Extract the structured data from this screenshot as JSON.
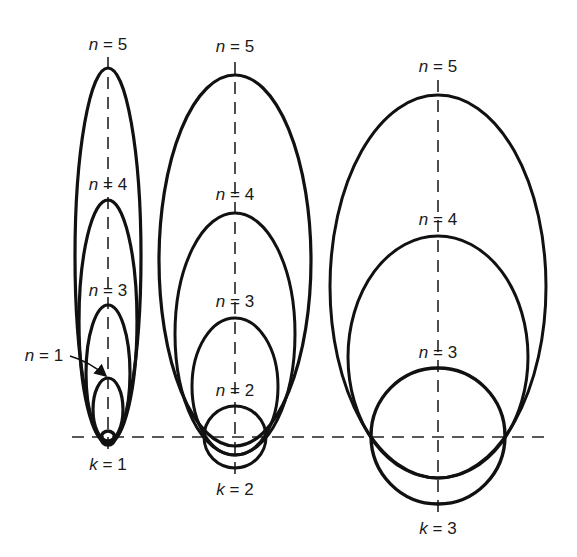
{
  "diagram": {
    "title": "",
    "stroke_color": "#111111",
    "baseline_y": 437,
    "groups": [
      {
        "k_label": "k = 1",
        "cx": 108,
        "k_label_y": 470,
        "axis_top": 57,
        "axis_bottom": 455,
        "orbits": [
          {
            "n_label": "n = 5",
            "label_y": 50,
            "top": 68,
            "bottom": 444,
            "rx": 33,
            "width": 3.2
          },
          {
            "n_label": "n = 4",
            "label_y": 190,
            "top": 200,
            "bottom": 443,
            "rx": 29,
            "width": 3.2
          },
          {
            "n_label": "n = 3",
            "label_y": 296,
            "top": 305,
            "bottom": 442,
            "rx": 22,
            "width": 3.2
          },
          {
            "n_label": "",
            "label_y": 0,
            "top": 378,
            "bottom": 441,
            "rx": 15,
            "width": 3.2
          },
          {
            "n_label": "",
            "label_y": 0,
            "top": 431,
            "bottom": 445,
            "rx": 7,
            "width": 3.6
          }
        ],
        "arrow_label": "n = 1",
        "arrow_label_x": 22,
        "arrow_label_y": 361
      },
      {
        "k_label": "k = 2",
        "cx": 235,
        "k_label_y": 495,
        "axis_top": 62,
        "axis_bottom": 475,
        "orbits": [
          {
            "n_label": "n = 5",
            "label_y": 52,
            "top": 75,
            "bottom": 446,
            "rx": 76,
            "width": 3.2
          },
          {
            "n_label": "n = 4",
            "label_y": 200,
            "top": 213,
            "bottom": 455,
            "rx": 60,
            "width": 3.0
          },
          {
            "n_label": "n = 3",
            "label_y": 307,
            "top": 318,
            "bottom": 455,
            "rx": 43,
            "width": 3.0
          },
          {
            "n_label": "n = 2",
            "label_y": 396,
            "top": 406,
            "bottom": 468,
            "rx": 31,
            "width": 3.0
          }
        ]
      },
      {
        "k_label": "k = 3",
        "cx": 438,
        "k_label_y": 534,
        "axis_top": 80,
        "axis_bottom": 515,
        "orbits": [
          {
            "n_label": "n = 5",
            "label_y": 72,
            "top": 95,
            "bottom": 478,
            "rx": 108,
            "width": 3.0
          },
          {
            "n_label": "n = 4",
            "label_y": 225,
            "top": 236,
            "bottom": 478,
            "rx": 90,
            "width": 3.0
          },
          {
            "n_label": "n = 3",
            "label_y": 358,
            "top": 368,
            "bottom": 504,
            "rx": 67,
            "width": 3.4
          }
        ]
      }
    ]
  }
}
